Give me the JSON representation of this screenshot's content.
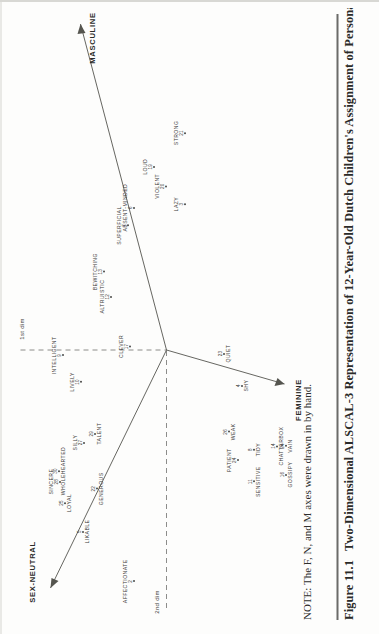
{
  "figure": {
    "number": "Figure 11.1",
    "caption": "Two-Dimensional ALSCAL-3 Representation of 12-Year-Old Dutch Children's Assignment of Personality Traits to th",
    "note": "NOTE: The F, N, and M axes were drawn in by hand."
  },
  "axes": {
    "dim1_label": "1st dim",
    "dim2_label": "2nd dim",
    "hand_axes": [
      {
        "name": "SEX-NEUTRAL",
        "code": "N"
      },
      {
        "name": "MASCULINE",
        "code": "M"
      },
      {
        "name": "FEMININE",
        "code": "F"
      }
    ]
  },
  "chart_data": {
    "type": "scatter",
    "title": "Two-Dimensional ALSCAL-3 Representation of 12-Year-Old Dutch Children's Assignment of Personality Traits to th",
    "xlabel": "1st dim",
    "ylabel": "2nd dim",
    "grid": false,
    "legend": "none",
    "xlim": [
      -1.6,
      1.6
    ],
    "ylim": [
      -1.4,
      1.4
    ],
    "annotations": [
      "SEX-NEUTRAL",
      "MASCULINE",
      "FEMININE",
      "1st dim",
      "2nd dim"
    ],
    "points": [
      {
        "id": "2",
        "label": "AFFECTIONATE",
        "x": -1.3,
        "y": 0.3,
        "place": "above-left"
      },
      {
        "id": "5",
        "label": "LIKABLE",
        "x": -1.02,
        "y": 0.66,
        "place": "below"
      },
      {
        "id": "25",
        "label": "LOYAL",
        "x": -0.86,
        "y": 0.8,
        "place": "below"
      },
      {
        "id": "28",
        "label": "SINCERE",
        "x": -0.74,
        "y": 0.89,
        "place": "above"
      },
      {
        "id": "30",
        "label": "WHOLEHEARTED",
        "x": -0.68,
        "y": 0.85,
        "place": "below"
      },
      {
        "id": "22",
        "label": "GENEROUS",
        "x": -0.78,
        "y": 0.55,
        "place": "below"
      },
      {
        "id": "27",
        "label": "SILLY",
        "x": -0.52,
        "y": 0.7,
        "place": "above"
      },
      {
        "id": "29",
        "label": "TALENT",
        "x": -0.47,
        "y": 0.56,
        "place": "below"
      },
      {
        "id": "10",
        "label": "LIVELY",
        "x": -0.18,
        "y": 0.72,
        "place": "above"
      },
      {
        "id": "9",
        "label": "INTELLIGENT",
        "x": -0.03,
        "y": 0.86,
        "place": "above"
      },
      {
        "id": "17",
        "label": "CLEVER",
        "x": 0.02,
        "y": 0.33,
        "place": "above"
      },
      {
        "id": "12",
        "label": "ALTRUISTIC",
        "x": 0.3,
        "y": 0.48,
        "place": "above"
      },
      {
        "id": "13",
        "label": "BEWITCHING",
        "x": 0.44,
        "y": 0.54,
        "place": "above"
      },
      {
        "id": "7",
        "label": "SUPERFICIAL",
        "x": 0.7,
        "y": 0.35,
        "place": "above"
      },
      {
        "id": "6",
        "label": "ABSENT-MINDED",
        "x": 0.8,
        "y": 0.3,
        "place": "above"
      },
      {
        "id": "3",
        "label": "LAZY",
        "x": 0.82,
        "y": -0.1,
        "place": "above"
      },
      {
        "id": "20",
        "label": "VIOLENT",
        "x": 0.92,
        "y": 0.05,
        "place": "above"
      },
      {
        "id": "19",
        "label": "LOUD",
        "x": 1.03,
        "y": 0.14,
        "place": "above"
      },
      {
        "id": "21",
        "label": "STRONG",
        "x": 1.22,
        "y": -0.1,
        "place": "above"
      },
      {
        "id": "24",
        "label": "PATIENT",
        "x": -0.62,
        "y": -0.52,
        "place": "above"
      },
      {
        "id": "26",
        "label": "WEAK",
        "x": -0.46,
        "y": -0.5,
        "place": "below"
      },
      {
        "id": "11",
        "label": "SENSITIVE",
        "x": -0.74,
        "y": -0.7,
        "place": "below"
      },
      {
        "id": "8",
        "label": "TIDY",
        "x": -0.56,
        "y": -0.7,
        "place": "below"
      },
      {
        "id": "14",
        "label": "CHATTERBOX",
        "x": -0.54,
        "y": -0.88,
        "place": "below"
      },
      {
        "id": "16",
        "label": "GOSSIPY",
        "x": -0.7,
        "y": -1.06,
        "place": "below"
      },
      {
        "id": "24b",
        "label": "VAIN",
        "x": -0.54,
        "y": -1.18,
        "place": "below"
      },
      {
        "id": "4",
        "label": "SHY",
        "x": -0.2,
        "y": -0.6,
        "place": "below"
      },
      {
        "id": "23",
        "label": "QUIET",
        "x": -0.02,
        "y": -0.46,
        "place": "below"
      }
    ]
  }
}
